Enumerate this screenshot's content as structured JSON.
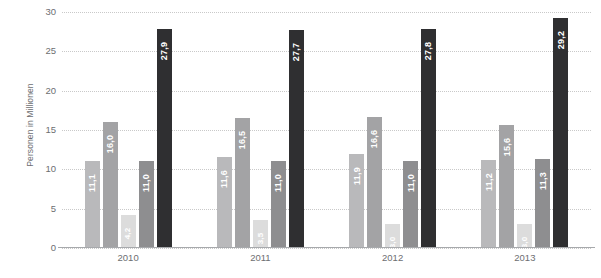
{
  "chart_data": {
    "type": "bar",
    "title": "",
    "xlabel": "",
    "ylabel": "Personen in Millionen",
    "categories": [
      "2010",
      "2011",
      "2012",
      "2013"
    ],
    "ylim": [
      0,
      30
    ],
    "yticks": [
      "0",
      "5",
      "10",
      "15",
      "20",
      "25",
      "30"
    ],
    "ytick_values": [
      0,
      5,
      10,
      15,
      20,
      25,
      30
    ],
    "grid": true,
    "legend": "none",
    "decimal_separator": ",",
    "series": [
      {
        "name": "series-1",
        "color": "#b9b9bb",
        "values": [
          11.1,
          11.6,
          11.9,
          11.2
        ],
        "labels": [
          "11,1",
          "11,6",
          "11,9",
          "11,2"
        ]
      },
      {
        "name": "series-2",
        "color": "#a3a3a5",
        "values": [
          16.0,
          16.5,
          16.6,
          15.6
        ],
        "labels": [
          "16,0",
          "16,5",
          "16,6",
          "15,6"
        ]
      },
      {
        "name": "series-3",
        "color": "#dcdcdc",
        "values": [
          4.2,
          3.5,
          3.0,
          3.0
        ],
        "labels": [
          "4,2",
          "3,5",
          "3,0",
          "3,0"
        ]
      },
      {
        "name": "series-4",
        "color": "#8e8e90",
        "values": [
          11.0,
          11.0,
          11.0,
          11.3
        ],
        "labels": [
          "11,0",
          "11,0",
          "11,0",
          "11,3"
        ]
      },
      {
        "name": "series-5",
        "color": "#2f2f31",
        "values": [
          27.9,
          27.7,
          27.8,
          29.2
        ],
        "labels": [
          "27,9",
          "27,7",
          "27,8",
          "29,2"
        ]
      }
    ]
  }
}
